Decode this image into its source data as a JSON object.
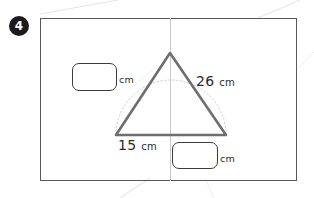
{
  "worksheet": {
    "question_number": "4",
    "panel": {
      "border_color": "#595959",
      "fold_line_color": "#c9c9c9"
    }
  },
  "figure": {
    "shape": "isosceles-triangle-in-semicircle",
    "triangle_stroke_color": "#6e6e6e",
    "arc_stroke_color": "#cfcfcf",
    "arc_style": "dotted",
    "apex": {
      "x": 170,
      "y": 53
    },
    "base_left": {
      "x": 116,
      "y": 135
    },
    "base_right": {
      "x": 226,
      "y": 135
    }
  },
  "labels": {
    "hypotenuse": {
      "value": "26",
      "unit": "cm"
    },
    "base": {
      "value": "15",
      "unit": "cm"
    }
  },
  "answers": {
    "left": {
      "value": "",
      "unit": "cm"
    },
    "bottom": {
      "value": "",
      "unit": "cm"
    }
  }
}
